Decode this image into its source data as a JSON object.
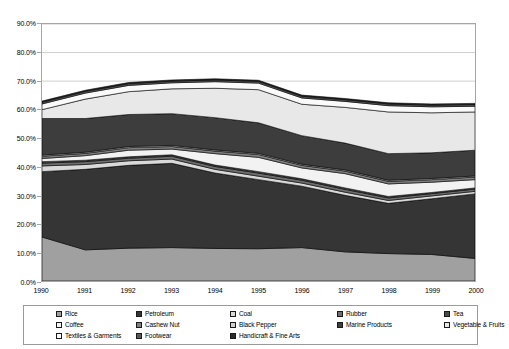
{
  "chart_data": {
    "type": "area",
    "stacked": true,
    "title": "",
    "xlabel": "",
    "ylabel": "",
    "x": [
      1990,
      1991,
      1992,
      1993,
      1994,
      1995,
      1996,
      1997,
      1998,
      1999,
      2000
    ],
    "categories": [
      "1990",
      "1991",
      "1992",
      "1993",
      "1994",
      "1995",
      "1996",
      "1997",
      "1998",
      "1999",
      "2000"
    ],
    "ylim": [
      0,
      90
    ],
    "ytick_values": [
      0,
      10,
      20,
      30,
      40,
      50,
      60,
      70,
      80,
      90
    ],
    "ytick_labels": [
      "0.0%",
      "10.0%",
      "20.0%",
      "30.0%",
      "40.0%",
      "50.0%",
      "60.0%",
      "70.0%",
      "80.0%",
      "90.0%"
    ],
    "grid": true,
    "grid_axis": "y",
    "legend_position": "bottom",
    "series": [
      {
        "name": "Rice",
        "color": "#a0a0a0",
        "values": [
          15.4,
          10.9,
          11.5,
          11.7,
          11.4,
          11.3,
          11.7,
          10.2,
          9.6,
          9.3,
          7.9
        ]
      },
      {
        "name": "Petroleum",
        "color": "#353535",
        "values": [
          22.9,
          28.2,
          29.0,
          29.5,
          26.4,
          24.2,
          21.5,
          19.8,
          17.6,
          19.5,
          22.6
        ]
      },
      {
        "name": "Coal",
        "color": "#d9d9d9",
        "values": [
          2.0,
          1.7,
          1.6,
          1.5,
          1.3,
          1.2,
          1.1,
          1.1,
          1.0,
          1.0,
          0.9
        ]
      },
      {
        "name": "Rubber",
        "color": "#6e6e6e",
        "values": [
          1.0,
          1.0,
          0.9,
          1.0,
          1.0,
          1.1,
          1.0,
          1.0,
          0.9,
          0.8,
          0.8
        ]
      },
      {
        "name": "Tea",
        "color": "#4a4a4a",
        "values": [
          0.5,
          0.5,
          0.5,
          0.5,
          0.5,
          0.5,
          0.5,
          0.5,
          0.5,
          0.4,
          0.4
        ]
      },
      {
        "name": "Coffee",
        "color": "#f2f2f2",
        "values": [
          1.1,
          1.6,
          2.3,
          2.0,
          4.0,
          5.0,
          3.8,
          5.0,
          4.4,
          3.6,
          2.9
        ]
      },
      {
        "name": "Cashew Nut",
        "color": "#808080",
        "values": [
          0.8,
          0.8,
          0.9,
          0.9,
          0.9,
          1.0,
          0.9,
          0.9,
          0.9,
          0.9,
          0.9
        ]
      },
      {
        "name": "Black Pepper",
        "color": "#cfcfcf",
        "values": [
          0.4,
          0.4,
          0.4,
          0.4,
          0.4,
          0.4,
          0.4,
          0.4,
          0.4,
          0.4,
          0.4
        ]
      },
      {
        "name": "Marine Products",
        "color": "#3d3d3d",
        "values": [
          12.8,
          11.8,
          11.2,
          11.1,
          11.3,
          10.7,
          10.0,
          9.4,
          9.3,
          9.0,
          9.0
        ]
      },
      {
        "name": "Vegetable & Fruits",
        "color": "#e8e8e8",
        "values": [
          3.1,
          6.8,
          8.0,
          8.7,
          10.3,
          11.6,
          11.0,
          12.5,
          14.6,
          14.0,
          13.4
        ]
      },
      {
        "name": "Textiles & Garments",
        "color": "#fafafa",
        "values": [
          2.0,
          2.1,
          2.2,
          2.1,
          2.3,
          2.3,
          2.2,
          2.1,
          2.2,
          2.1,
          2.0
        ]
      },
      {
        "name": "Footwear",
        "color": "#5a5a5a",
        "values": [
          0.6,
          0.6,
          0.6,
          0.6,
          0.6,
          0.6,
          0.6,
          0.6,
          0.6,
          0.6,
          0.6
        ]
      },
      {
        "name": "Handicraft & Fine Arts",
        "color": "#2b2b2b",
        "values": [
          0.4,
          0.4,
          0.4,
          0.4,
          0.4,
          0.4,
          0.4,
          0.4,
          0.4,
          0.4,
          0.4
        ]
      }
    ]
  },
  "legend": {
    "items": [
      {
        "label": "Rice",
        "swatch": "#a0a0a0"
      },
      {
        "label": "Petroleum",
        "swatch": "#353535"
      },
      {
        "label": "Coal",
        "swatch": "#d9d9d9"
      },
      {
        "label": "Rubber",
        "swatch": "#6e6e6e"
      },
      {
        "label": "Tea",
        "swatch": "#4a4a4a"
      },
      {
        "label": "Coffee",
        "swatch": "#f2f2f2"
      },
      {
        "label": "Cashew Nut",
        "swatch": "#808080"
      },
      {
        "label": "Black Pepper",
        "swatch": "#cfcfcf"
      },
      {
        "label": "Marine Products",
        "swatch": "#3d3d3d"
      },
      {
        "label": "Vegetable & Fruits",
        "swatch": "#e8e8e8"
      },
      {
        "label": "Textiles & Garments",
        "swatch": "#fafafa"
      },
      {
        "label": "Footwear",
        "swatch": "#5a5a5a"
      },
      {
        "label": "Handicraft & Fine Arts",
        "swatch": "#2b2b2b"
      }
    ]
  },
  "colors": {
    "axis": "#a6a6a6",
    "grid": "#d0d0d0",
    "legend_border": "#9a9a9a",
    "text": "#000000",
    "background": "#ffffff"
  }
}
